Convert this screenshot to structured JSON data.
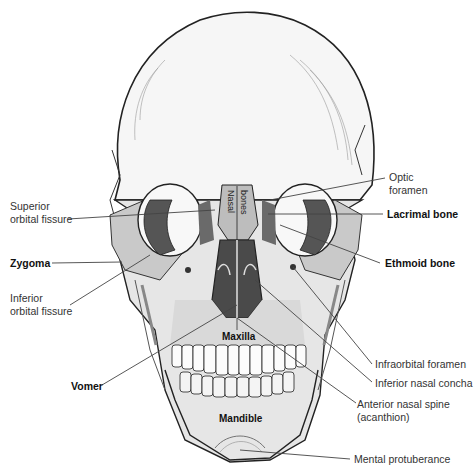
{
  "figure": {
    "labels_left": [
      {
        "id": "superior-orbital-fissure",
        "text": "Superior\norbital fissure",
        "bold": false
      },
      {
        "id": "zygoma",
        "text": "Zygoma",
        "bold": true
      },
      {
        "id": "inferior-orbital-fissure",
        "text": "Inferior\norbital fissure",
        "bold": false
      },
      {
        "id": "vomer",
        "text": "Vomer",
        "bold": true
      }
    ],
    "labels_right": [
      {
        "id": "optic-foramen",
        "text": "Optic\nforamen",
        "bold": false
      },
      {
        "id": "lacrimal-bone",
        "text": "Lacrimal bone",
        "bold": true
      },
      {
        "id": "ethmoid-bone",
        "text": "Ethmoid bone",
        "bold": true
      },
      {
        "id": "infraorbital-foramen",
        "text": "Infraorbital foramen",
        "bold": false
      },
      {
        "id": "inferior-nasal-concha",
        "text": "Inferior nasal concha",
        "bold": false
      },
      {
        "id": "anterior-nasal-spine",
        "text": "Anterior nasal spine\n(acanthion)",
        "bold": false
      },
      {
        "id": "mental-protuberance",
        "text": "Mental protuberance",
        "bold": false
      }
    ],
    "labels_inner": {
      "nasal_left": "Nasal",
      "nasal_right": "bones",
      "maxilla": "Maxilla",
      "mandible": "Mandible"
    },
    "colors": {
      "bone_light": "#f2f2f2",
      "bone_shade": "#d4d4d4",
      "highlight_gray": "#bdbdbd",
      "cavity_dark": "#4a4a4a",
      "ink": "#222222",
      "leader": "#444444"
    }
  }
}
